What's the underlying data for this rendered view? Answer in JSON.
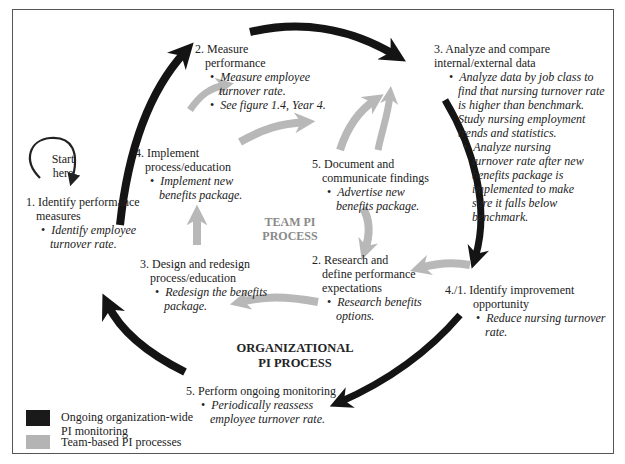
{
  "diagram": {
    "start": {
      "line1": "Start",
      "line2": "here"
    },
    "org_label": {
      "line1": "ORGANIZATIONAL",
      "line2": "PI PROCESS"
    },
    "team_label": {
      "line1": "TEAM PI",
      "line2": "PROCESS"
    },
    "org_steps": [
      {
        "title1": "1. Identify performance",
        "title2": "measures",
        "bullets": [
          "Identify employee turnover rate."
        ]
      },
      {
        "title1": "2. Measure",
        "title2": "performance",
        "bullets": [
          "Measure employee turnover rate.",
          "See figure 1.4, Year 4."
        ]
      },
      {
        "title1": "3.  Analyze and compare",
        "title2": "internal/external data",
        "bullets": [
          "Analyze data by job class to find that nursing turnover rate is higher than benchmark. Study nursing employment trends and statistics.",
          "Analyze nursing turnover rate after new benefits package is implemented to make sure it falls below benchmark."
        ]
      },
      {
        "title1": "4./1. Identify improvement",
        "title2": "opportunity",
        "bullets": [
          "Reduce nursing turnover rate."
        ]
      },
      {
        "title1": "5. Perform ongoing monitoring",
        "title2": "",
        "bullets": [
          "Periodically reassess employee turnover rate."
        ]
      }
    ],
    "team_steps": [
      {
        "title1": "2. Research and",
        "title2": "define performance",
        "title3": "expectations",
        "bullets": [
          "Research benefits options."
        ]
      },
      {
        "title1": "3. Design and redesign",
        "title2": "process/education",
        "bullets": [
          "Redesign the benefits package."
        ]
      },
      {
        "title1": "4. Implement",
        "title2": "process/education",
        "bullets": [
          "Implement new benefits package."
        ]
      },
      {
        "title1": "5. Document and",
        "title2": "communicate findings",
        "bullets": [
          "Advertise new benefits package."
        ]
      }
    ],
    "legend": [
      {
        "label1": "Ongoing organization-wide",
        "label2": "PI monitoring",
        "color": "#1a1a1a"
      },
      {
        "label1": "Team-based PI processes",
        "label2": "",
        "color": "#b4b4b4"
      }
    ],
    "colors": {
      "org_arrow": "#141414",
      "team_arrow": "#b8b8b8",
      "border": "#555555"
    }
  }
}
